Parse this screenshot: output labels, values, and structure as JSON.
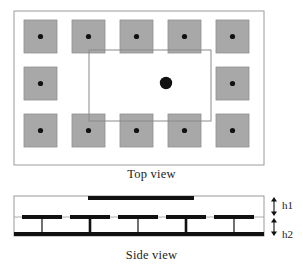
{
  "figure": {
    "canvas": {
      "width": 303,
      "height": 272,
      "background": "#ffffff"
    }
  },
  "colors": {
    "patch_fill": "#a8a8a8",
    "patch_stroke": "#8f8f8f",
    "outline": "#9a9a9a",
    "inner_outline": "#8a8a8a",
    "metal": "#111111",
    "dot": "#111111",
    "text": "#1c1c1c"
  },
  "top_view": {
    "caption": "Top view",
    "substrate_outline": {
      "x": 14,
      "y": 11,
      "width": 250,
      "height": 154
    },
    "inner_patch_outline": {
      "x": 89,
      "y": 50,
      "width": 122,
      "height": 71
    },
    "center_probe": {
      "cx": 166,
      "cy": 83,
      "r": 6.2,
      "name": "feed-probe"
    },
    "cell_size": 33,
    "via_dot_radius": 2.6,
    "unit_cells": [
      {
        "id": "cell-r1c1",
        "x": 24,
        "y": 20,
        "row": 1,
        "col": 1
      },
      {
        "id": "cell-r1c2",
        "x": 72,
        "y": 20,
        "row": 1,
        "col": 2
      },
      {
        "id": "cell-r1c3",
        "x": 120,
        "y": 20,
        "row": 1,
        "col": 3
      },
      {
        "id": "cell-r1c4",
        "x": 168,
        "y": 20,
        "row": 1,
        "col": 4
      },
      {
        "id": "cell-r1c5",
        "x": 216,
        "y": 20,
        "row": 1,
        "col": 5
      },
      {
        "id": "cell-r2c1",
        "x": 24,
        "y": 67,
        "row": 2,
        "col": 1
      },
      {
        "id": "cell-r2c5",
        "x": 216,
        "y": 67,
        "row": 2,
        "col": 5
      },
      {
        "id": "cell-r3c1",
        "x": 24,
        "y": 114,
        "row": 3,
        "col": 1
      },
      {
        "id": "cell-r3c2",
        "x": 72,
        "y": 114,
        "row": 3,
        "col": 2
      },
      {
        "id": "cell-r3c3",
        "x": 120,
        "y": 114,
        "row": 3,
        "col": 3
      },
      {
        "id": "cell-r3c4",
        "x": 168,
        "y": 114,
        "row": 3,
        "col": 4
      },
      {
        "id": "cell-r3c5",
        "x": 216,
        "y": 114,
        "row": 3,
        "col": 5
      }
    ]
  },
  "side_view": {
    "caption": "Side view",
    "substrate_outline": {
      "x": 14,
      "y": 196,
      "width": 250,
      "height": 40
    },
    "top_patch": {
      "x": 88,
      "y": 196,
      "width": 106,
      "height": 4
    },
    "mid_plane_y": 217,
    "ground_plane": {
      "x": 14,
      "y": 232,
      "width": 250,
      "height": 4
    },
    "ebg_patches": [
      {
        "id": "ebg-1",
        "x": 22,
        "width": 40,
        "via_x": 42,
        "via_weight": "thin"
      },
      {
        "id": "ebg-2",
        "x": 70,
        "width": 40,
        "via_x": 90,
        "via_weight": "thick"
      },
      {
        "id": "ebg-3",
        "x": 118,
        "width": 40,
        "via_x": 138,
        "via_weight": "thin"
      },
      {
        "id": "ebg-4",
        "x": 166,
        "width": 40,
        "via_x": 186,
        "via_weight": "thick"
      },
      {
        "id": "ebg-5",
        "x": 214,
        "width": 40,
        "via_x": 234,
        "via_weight": "thin"
      }
    ],
    "dimensions": [
      {
        "id": "h1",
        "label": "h1",
        "arrow_x": 274,
        "y_top": 197,
        "y_bottom": 216,
        "label_x": 282,
        "label_y": 199
      },
      {
        "id": "h2",
        "label": "h2",
        "arrow_x": 274,
        "y_top": 218,
        "y_bottom": 236,
        "label_x": 282,
        "label_y": 228
      }
    ]
  }
}
